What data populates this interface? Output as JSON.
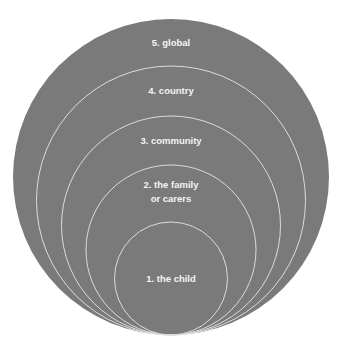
{
  "diagram": {
    "type": "nested-circles",
    "colors": {
      "fill": "#7a7a7a",
      "outline": "#dcdcdc",
      "text": "#f4f4f4",
      "background": "#ffffff"
    },
    "levels": [
      {
        "number": 1,
        "lines": [
          "1. the child"
        ]
      },
      {
        "number": 2,
        "lines": [
          "2. the family",
          "or carers"
        ]
      },
      {
        "number": 3,
        "lines": [
          "3. community"
        ]
      },
      {
        "number": 4,
        "lines": [
          "4. country"
        ]
      },
      {
        "number": 5,
        "lines": [
          "5. global"
        ]
      }
    ]
  }
}
